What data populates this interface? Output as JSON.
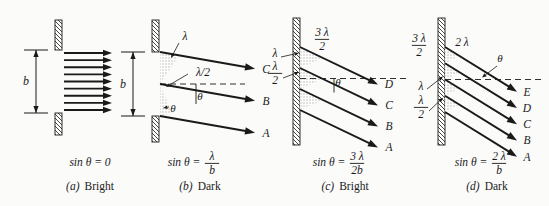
{
  "figure": {
    "background_color": "#fbfbfa",
    "ink_color": "#1a1a1a",
    "stipple_color": "#b9b4ad",
    "symbols": {
      "lambda": "λ",
      "theta": "θ",
      "slit_width": "b"
    }
  },
  "panels": [
    {
      "id": "a",
      "panel_label": "(a)",
      "condition": "Bright",
      "equation": {
        "lhs": "sin θ",
        "eq": "=",
        "rhs_plain": "0",
        "numerator": "",
        "denominator": "",
        "stacked": false
      },
      "slit_label": "b",
      "ray_labels": [],
      "path_labels": [],
      "angle_labels": [],
      "ray_count": 9
    },
    {
      "id": "b",
      "panel_label": "(b)",
      "condition": "Dark",
      "equation": {
        "lhs": "sin θ",
        "eq": "=",
        "rhs_plain": "",
        "numerator": "λ",
        "denominator": "b",
        "stacked": true
      },
      "slit_label": "b",
      "ray_labels": [
        "C",
        "B",
        "A"
      ],
      "path_labels": [
        "λ",
        "λ/2"
      ],
      "angle_labels": [
        "θ",
        "θ"
      ],
      "ray_count": 3
    },
    {
      "id": "c",
      "panel_label": "(c)",
      "condition": "Bright",
      "equation": {
        "lhs": "sin θ",
        "eq": "=",
        "rhs_plain": "",
        "numerator": "3 λ",
        "denominator": "2b",
        "stacked": true
      },
      "slit_label": "",
      "ray_labels": [
        "D",
        "C",
        "B",
        "A"
      ],
      "path_labels": [
        "3λ/2",
        "λ",
        "λ/2"
      ],
      "angle_labels": [
        "θ"
      ],
      "ray_count": 4
    },
    {
      "id": "d",
      "panel_label": "(d)",
      "condition": "Dark",
      "equation": {
        "lhs": "sin θ",
        "eq": "=",
        "rhs_plain": "",
        "numerator": "2 λ",
        "denominator": "b",
        "stacked": true
      },
      "slit_label": "",
      "ray_labels": [
        "E",
        "D",
        "C",
        "B",
        "A"
      ],
      "path_labels": [
        "3λ/2",
        "2 λ",
        "λ",
        "λ/2"
      ],
      "angle_labels": [
        "θ"
      ],
      "ray_count": 5
    }
  ]
}
